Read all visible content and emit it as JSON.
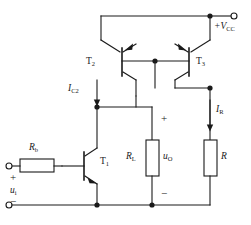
{
  "figure": {
    "kind": "circuit-schematic",
    "width": 251,
    "height": 225,
    "line_color": "#1a1a1a",
    "text_color": "#1a1a1a",
    "background": "#ffffff"
  },
  "labels": {
    "supply": "+V",
    "supply_sub": "CC",
    "t2": "T",
    "t2_sub": "2",
    "t3": "T",
    "t3_sub": "3",
    "t1": "T",
    "t1_sub": "1",
    "ic2": "I",
    "ic2_sub": "C2",
    "ir": "I",
    "ir_sub": "R",
    "rb": "R",
    "rb_sub": "b",
    "rl": "R",
    "rl_sub": "L",
    "uo": "u",
    "uo_sub": "O",
    "ui": "u",
    "ui_sub": "i",
    "r": "R",
    "plus_input": "+",
    "minus_input": "−",
    "plus_output": "+",
    "minus_output": "−"
  },
  "components": [
    {
      "id": "T1",
      "type": "transistor-npn",
      "label": "T1"
    },
    {
      "id": "T2",
      "type": "transistor-pnp",
      "label": "T2"
    },
    {
      "id": "T3",
      "type": "transistor-pnp",
      "label": "T3"
    },
    {
      "id": "Rb",
      "type": "resistor",
      "orientation": "horizontal",
      "label": "Rb"
    },
    {
      "id": "RL",
      "type": "resistor",
      "orientation": "vertical",
      "label": "RL"
    },
    {
      "id": "R",
      "type": "resistor",
      "orientation": "vertical",
      "label": "R"
    }
  ],
  "terminals": [
    {
      "id": "vcc",
      "label": "+VCC"
    },
    {
      "id": "input-plus",
      "label": "+"
    },
    {
      "id": "input-minus",
      "label": "−"
    }
  ],
  "currents": [
    {
      "id": "IC2",
      "label": "IC2",
      "direction": "down"
    },
    {
      "id": "IR",
      "label": "IR",
      "direction": "down"
    }
  ]
}
